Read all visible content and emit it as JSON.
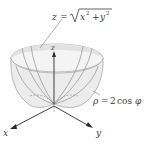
{
  "diagram": {
    "labels": {
      "cone_equation": {
        "lhs": "z",
        "eq": "=",
        "radicand_x": "x",
        "sup_x": "2",
        "plus": "+",
        "radicand_y": "y",
        "sup_y": "2",
        "full": "z = √(x² + y²)"
      },
      "sphere_equation": {
        "lhs": "ρ",
        "eq": "=",
        "coef": "2",
        "fn": "cos",
        "arg": "φ",
        "full": "ρ = 2 cos φ"
      },
      "axes": {
        "x": "x",
        "y": "y",
        "z": "z"
      }
    },
    "colors": {
      "surface_fill": "#ececec",
      "surface_edge": "#a8a8a8",
      "axis": "#2a2a2a",
      "text": "#3a3a3a"
    }
  }
}
